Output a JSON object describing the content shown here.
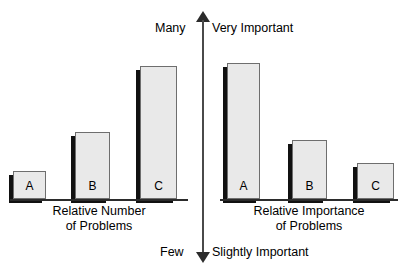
{
  "axis": {
    "top_left_label": "Many",
    "top_right_label": "Very Important",
    "bottom_left_label": "Few",
    "bottom_right_label": "Slightly Important",
    "arrow_color": "#2b2b2b",
    "line_color": "#4a4a4a"
  },
  "panels": {
    "left": {
      "caption_line1": "Relative Number",
      "caption_line2": "of Problems"
    },
    "right": {
      "caption_line1": "Relative Importance",
      "caption_line2": "of Problems"
    }
  },
  "style": {
    "bar_fill": "#e9e9e9",
    "bar_border": "#6e6e6e",
    "bar_shadow": "#111111",
    "background": "#ffffff"
  },
  "chart_data": [
    {
      "type": "bar",
      "title": "Relative Number of Problems",
      "xlabel": "",
      "ylabel": "Number of Problems",
      "categories": [
        "A",
        "B",
        "C"
      ],
      "values": [
        18,
        43,
        86
      ],
      "ylim": [
        0,
        100
      ],
      "axis_min_label": "Few",
      "axis_max_label": "Many",
      "grid": false,
      "legend": "none",
      "orientation": "vertical"
    },
    {
      "type": "bar",
      "title": "Relative Importance of Problems",
      "xlabel": "",
      "ylabel": "Importance of Problems",
      "categories": [
        "A",
        "B",
        "C"
      ],
      "values": [
        88,
        38,
        23
      ],
      "ylim": [
        0,
        100
      ],
      "axis_min_label": "Slightly Important",
      "axis_max_label": "Very Important",
      "grid": false,
      "legend": "none",
      "orientation": "vertical"
    }
  ]
}
